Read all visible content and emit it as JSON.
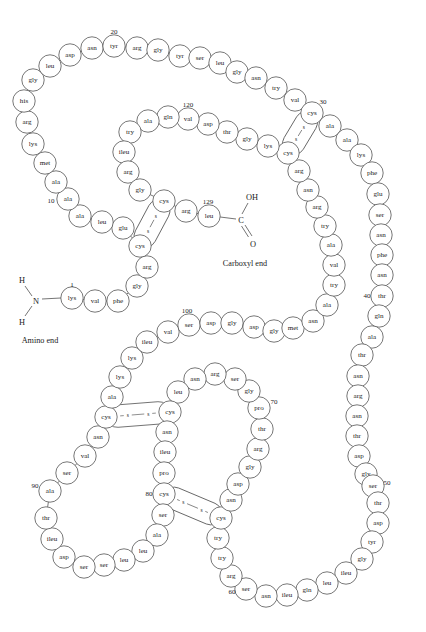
{
  "figure": {
    "type": "protein-primary-structure-diagram",
    "molecule": "lysozyme",
    "residue_count": 129,
    "amino_end_label": "Amino end",
    "carboxyl_end_label": "Carboxyl end",
    "amino_group": {
      "n": "N",
      "h_top": "H",
      "h_bottom": "H"
    },
    "carboxyl_group": {
      "oh": "OH",
      "o": "O",
      "c": "C"
    },
    "sulfur_label": "s",
    "colors": {
      "background": "#ffffff",
      "circle_stroke": "#4a4a4a",
      "circle_fill": "#ffffff",
      "text": "#1b1b1b"
    },
    "number_markers": [
      1,
      10,
      20,
      30,
      40,
      50,
      60,
      70,
      80,
      90,
      100,
      120,
      129
    ]
  },
  "sequence": [
    {
      "n": 1,
      "aa": "lys",
      "x": 72,
      "y": 298
    },
    {
      "n": 2,
      "aa": "val",
      "x": 95,
      "y": 301
    },
    {
      "n": 3,
      "aa": "phe",
      "x": 118,
      "y": 301
    },
    {
      "n": 4,
      "aa": "gly",
      "x": 137,
      "y": 286
    },
    {
      "n": 5,
      "aa": "arg",
      "x": 147,
      "y": 267
    },
    {
      "n": 6,
      "aa": "cys",
      "x": 140,
      "y": 246
    },
    {
      "n": 7,
      "aa": "glu",
      "x": 123,
      "y": 228
    },
    {
      "n": 8,
      "aa": "leu",
      "x": 102,
      "y": 222
    },
    {
      "n": 9,
      "aa": "ala",
      "x": 80,
      "y": 216
    },
    {
      "n": 10,
      "aa": "ala",
      "x": 68,
      "y": 199
    },
    {
      "n": 11,
      "aa": "ala",
      "x": 56,
      "y": 182
    },
    {
      "n": 12,
      "aa": "met",
      "x": 45,
      "y": 163
    },
    {
      "n": 13,
      "aa": "lys",
      "x": 33,
      "y": 144
    },
    {
      "n": 14,
      "aa": "arg",
      "x": 27,
      "y": 122
    },
    {
      "n": 15,
      "aa": "his",
      "x": 24,
      "y": 101
    },
    {
      "n": 16,
      "aa": "gly",
      "x": 33,
      "y": 80
    },
    {
      "n": 17,
      "aa": "leu",
      "x": 50,
      "y": 66
    },
    {
      "n": 18,
      "aa": "asp",
      "x": 70,
      "y": 55
    },
    {
      "n": 19,
      "aa": "asn",
      "x": 92,
      "y": 48
    },
    {
      "n": 20,
      "aa": "tyr",
      "x": 114,
      "y": 46
    },
    {
      "n": 21,
      "aa": "arg",
      "x": 137,
      "y": 48
    },
    {
      "n": 22,
      "aa": "gly",
      "x": 158,
      "y": 50
    },
    {
      "n": 23,
      "aa": "tyr",
      "x": 180,
      "y": 56
    },
    {
      "n": 24,
      "aa": "ser",
      "x": 200,
      "y": 58
    },
    {
      "n": 25,
      "aa": "leu",
      "x": 220,
      "y": 63
    },
    {
      "n": 26,
      "aa": "gly",
      "x": 237,
      "y": 72
    },
    {
      "n": 27,
      "aa": "asn",
      "x": 256,
      "y": 78
    },
    {
      "n": 28,
      "aa": "try",
      "x": 276,
      "y": 88
    },
    {
      "n": 29,
      "aa": "val",
      "x": 295,
      "y": 100
    },
    {
      "n": 30,
      "aa": "cys",
      "x": 312,
      "y": 113
    },
    {
      "n": 31,
      "aa": "ala",
      "x": 330,
      "y": 126
    },
    {
      "n": 32,
      "aa": "ala",
      "x": 347,
      "y": 140
    },
    {
      "n": 33,
      "aa": "lys",
      "x": 361,
      "y": 155
    },
    {
      "n": 34,
      "aa": "phe",
      "x": 372,
      "y": 173
    },
    {
      "n": 35,
      "aa": "glu",
      "x": 378,
      "y": 194
    },
    {
      "n": 36,
      "aa": "ser",
      "x": 380,
      "y": 215
    },
    {
      "n": 37,
      "aa": "asn",
      "x": 381,
      "y": 235
    },
    {
      "n": 38,
      "aa": "phe",
      "x": 382,
      "y": 255
    },
    {
      "n": 39,
      "aa": "asn",
      "x": 382,
      "y": 275
    },
    {
      "n": 40,
      "aa": "thr",
      "x": 382,
      "y": 296
    },
    {
      "n": 41,
      "aa": "gln",
      "x": 379,
      "y": 316
    },
    {
      "n": 42,
      "aa": "ala",
      "x": 372,
      "y": 337
    },
    {
      "n": 43,
      "aa": "thr",
      "x": 362,
      "y": 355
    },
    {
      "n": 44,
      "aa": "asn",
      "x": 358,
      "y": 376
    },
    {
      "n": 45,
      "aa": "arg",
      "x": 358,
      "y": 396
    },
    {
      "n": 46,
      "aa": "asn",
      "x": 357,
      "y": 416
    },
    {
      "n": 47,
      "aa": "thr",
      "x": 357,
      "y": 436
    },
    {
      "n": 48,
      "aa": "asp",
      "x": 359,
      "y": 456
    },
    {
      "n": 49,
      "aa": "gly",
      "x": 366,
      "y": 474
    },
    {
      "n": 50,
      "aa": "ser",
      "x": 373,
      "y": 486
    },
    {
      "n": 51,
      "aa": "thr",
      "x": 378,
      "y": 503
    },
    {
      "n": 52,
      "aa": "asp",
      "x": 378,
      "y": 523
    },
    {
      "n": 53,
      "aa": "tyr",
      "x": 372,
      "y": 542
    },
    {
      "n": 54,
      "aa": "gly",
      "x": 362,
      "y": 559
    },
    {
      "n": 55,
      "aa": "ileu",
      "x": 346,
      "y": 573
    },
    {
      "n": 56,
      "aa": "leu",
      "x": 327,
      "y": 583
    },
    {
      "n": 57,
      "aa": "gln",
      "x": 307,
      "y": 590
    },
    {
      "n": 58,
      "aa": "ileu",
      "x": 287,
      "y": 595
    },
    {
      "n": 59,
      "aa": "asn",
      "x": 266,
      "y": 596
    },
    {
      "n": 60,
      "aa": "ser",
      "x": 246,
      "y": 589
    },
    {
      "n": 61,
      "aa": "arg",
      "x": 231,
      "y": 576
    },
    {
      "n": 62,
      "aa": "try",
      "x": 222,
      "y": 558
    },
    {
      "n": 63,
      "aa": "try",
      "x": 218,
      "y": 538
    },
    {
      "n": 64,
      "aa": "cys",
      "x": 221,
      "y": 518
    },
    {
      "n": 65,
      "aa": "asn",
      "x": 231,
      "y": 500
    },
    {
      "n": 66,
      "aa": "asp",
      "x": 238,
      "y": 484
    },
    {
      "n": 67,
      "aa": "gly",
      "x": 250,
      "y": 467
    },
    {
      "n": 68,
      "aa": "arg",
      "x": 258,
      "y": 449
    },
    {
      "n": 69,
      "aa": "thr",
      "x": 262,
      "y": 429
    },
    {
      "n": 70,
      "aa": "pro",
      "x": 259,
      "y": 408
    },
    {
      "n": 71,
      "aa": "gly",
      "x": 249,
      "y": 391
    },
    {
      "n": 72,
      "aa": "ser",
      "x": 235,
      "y": 379
    },
    {
      "n": 73,
      "aa": "arg",
      "x": 215,
      "y": 374
    },
    {
      "n": 74,
      "aa": "asn",
      "x": 195,
      "y": 379
    },
    {
      "n": 75,
      "aa": "leu",
      "x": 178,
      "y": 392
    },
    {
      "n": 76,
      "aa": "cys",
      "x": 170,
      "y": 412
    },
    {
      "n": 77,
      "aa": "asn",
      "x": 167,
      "y": 432
    },
    {
      "n": 78,
      "aa": "ileu",
      "x": 165,
      "y": 452
    },
    {
      "n": 79,
      "aa": "pro",
      "x": 164,
      "y": 473
    },
    {
      "n": 80,
      "aa": "cys",
      "x": 164,
      "y": 494
    },
    {
      "n": 81,
      "aa": "ser",
      "x": 163,
      "y": 515
    },
    {
      "n": 82,
      "aa": "ala",
      "x": 157,
      "y": 535
    },
    {
      "n": 83,
      "aa": "leu",
      "x": 143,
      "y": 551
    },
    {
      "n": 84,
      "aa": "leu",
      "x": 124,
      "y": 560
    },
    {
      "n": 85,
      "aa": "ser",
      "x": 104,
      "y": 565
    },
    {
      "n": 86,
      "aa": "ser",
      "x": 84,
      "y": 567
    },
    {
      "n": 87,
      "aa": "asp",
      "x": 64,
      "y": 557
    },
    {
      "n": 88,
      "aa": "ileu",
      "x": 52,
      "y": 539
    },
    {
      "n": 89,
      "aa": "thr",
      "x": 46,
      "y": 518
    },
    {
      "n": 90,
      "aa": "ala",
      "x": 50,
      "y": 491
    },
    {
      "n": 91,
      "aa": "ser",
      "x": 67,
      "y": 473
    },
    {
      "n": 92,
      "aa": "val",
      "x": 85,
      "y": 456
    },
    {
      "n": 93,
      "aa": "asn",
      "x": 98,
      "y": 437
    },
    {
      "n": 94,
      "aa": "cys",
      "x": 106,
      "y": 417
    },
    {
      "n": 95,
      "aa": "ala",
      "x": 112,
      "y": 397
    },
    {
      "n": 96,
      "aa": "lys",
      "x": 120,
      "y": 377
    },
    {
      "n": 97,
      "aa": "lys",
      "x": 132,
      "y": 358
    },
    {
      "n": 98,
      "aa": "ileu",
      "x": 147,
      "y": 342
    },
    {
      "n": 99,
      "aa": "val",
      "x": 168,
      "y": 332
    },
    {
      "n": 100,
      "aa": "ser",
      "x": 189,
      "y": 325
    },
    {
      "n": 101,
      "aa": "asp",
      "x": 211,
      "y": 323
    },
    {
      "n": 102,
      "aa": "gly",
      "x": 232,
      "y": 323
    },
    {
      "n": 103,
      "aa": "asp",
      "x": 254,
      "y": 327
    },
    {
      "n": 104,
      "aa": "gly",
      "x": 274,
      "y": 331
    },
    {
      "n": 105,
      "aa": "met",
      "x": 293,
      "y": 328
    },
    {
      "n": 106,
      "aa": "asn",
      "x": 313,
      "y": 321
    },
    {
      "n": 107,
      "aa": "ala",
      "x": 327,
      "y": 305
    },
    {
      "n": 108,
      "aa": "try",
      "x": 334,
      "y": 285
    },
    {
      "n": 109,
      "aa": "val",
      "x": 334,
      "y": 265
    },
    {
      "n": 110,
      "aa": "ala",
      "x": 331,
      "y": 245
    },
    {
      "n": 111,
      "aa": "try",
      "x": 325,
      "y": 226
    },
    {
      "n": 112,
      "aa": "arg",
      "x": 317,
      "y": 207
    },
    {
      "n": 113,
      "aa": "asn",
      "x": 308,
      "y": 190
    },
    {
      "n": 114,
      "aa": "arg",
      "x": 299,
      "y": 171
    },
    {
      "n": 115,
      "aa": "cys",
      "x": 288,
      "y": 153
    },
    {
      "n": 116,
      "aa": "lys",
      "x": 268,
      "y": 146
    },
    {
      "n": 117,
      "aa": "gly",
      "x": 247,
      "y": 139
    },
    {
      "n": 118,
      "aa": "thr",
      "x": 227,
      "y": 132
    },
    {
      "n": 119,
      "aa": "asp",
      "x": 208,
      "y": 124
    },
    {
      "n": 120,
      "aa": "val",
      "x": 188,
      "y": 119
    },
    {
      "n": 121,
      "aa": "gln",
      "x": 168,
      "y": 117
    },
    {
      "n": 122,
      "aa": "ala",
      "x": 148,
      "y": 121
    },
    {
      "n": 123,
      "aa": "try",
      "x": 130,
      "y": 132
    },
    {
      "n": 124,
      "aa": "ileu",
      "x": 124,
      "y": 152
    },
    {
      "n": 125,
      "aa": "arg",
      "x": 128,
      "y": 172
    },
    {
      "n": 126,
      "aa": "gly",
      "x": 140,
      "y": 190
    },
    {
      "n": 127,
      "aa": "cys",
      "x": 164,
      "y": 201
    },
    {
      "n": 128,
      "aa": "arg",
      "x": 186,
      "y": 211
    },
    {
      "n": 129,
      "aa": "leu",
      "x": 209,
      "y": 216
    }
  ],
  "disulfide_bridges": [
    {
      "from": 6,
      "to": 127,
      "orientation": "diagonal"
    },
    {
      "from": 30,
      "to": 115,
      "orientation": "diagonal"
    },
    {
      "from": 64,
      "to": 80,
      "orientation": "horizontal"
    },
    {
      "from": 76,
      "to": 94,
      "orientation": "horizontal"
    }
  ],
  "chain_backbone_order": [
    1,
    2,
    3,
    4,
    5,
    6,
    7,
    8,
    9,
    10,
    11,
    12,
    13,
    14,
    15,
    16,
    17,
    18,
    19,
    20,
    21,
    22,
    23,
    24,
    25,
    26,
    27,
    28,
    29,
    30,
    31,
    32,
    33,
    34,
    35,
    36,
    37,
    38,
    39,
    40,
    41,
    42,
    43,
    44,
    45,
    46,
    47,
    48,
    49,
    50,
    51,
    52,
    53,
    54,
    55,
    56,
    57,
    58,
    59,
    60,
    61,
    62,
    63,
    64,
    65,
    66,
    67,
    68,
    69,
    70,
    71,
    72,
    73,
    74,
    75,
    76,
    77,
    78,
    79,
    80,
    81,
    82,
    83,
    84,
    85,
    86,
    87,
    88,
    89,
    90,
    91,
    92,
    93,
    94,
    95,
    96,
    97,
    98,
    99,
    100,
    101,
    102,
    103,
    104,
    105,
    106,
    107,
    108,
    109,
    110,
    111,
    112,
    113,
    114,
    115,
    116,
    117,
    118,
    119,
    120,
    121,
    122,
    123,
    124,
    125,
    126,
    127,
    128,
    129
  ],
  "number_marker_offsets": {
    "1": {
      "dx": 0,
      "dy": -13
    },
    "10": {
      "dx": -17,
      "dy": 2
    },
    "20": {
      "dx": 0,
      "dy": -14
    },
    "30": {
      "dx": 11,
      "dy": -11
    },
    "40": {
      "dx": -15,
      "dy": 0
    },
    "50": {
      "dx": 14,
      "dy": -3
    },
    "60": {
      "dx": -14,
      "dy": 3
    },
    "70": {
      "dx": 15,
      "dy": -6
    },
    "80": {
      "dx": -15,
      "dy": 0
    },
    "90": {
      "dx": -15,
      "dy": -5
    },
    "100": {
      "dx": -2,
      "dy": -14
    },
    "120": {
      "dx": 0,
      "dy": -14
    },
    "129": {
      "dx": -1,
      "dy": -14
    }
  }
}
